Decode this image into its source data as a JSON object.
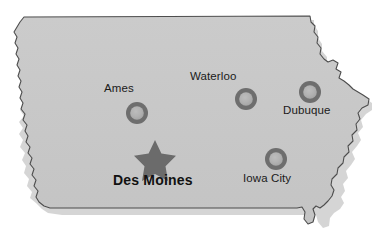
{
  "map": {
    "state": "Iowa",
    "fill_color": "#c8c8c8",
    "outline_color": "#4d4d4d",
    "shadow_color": "#b0b0b0",
    "background_color": "#ffffff",
    "marker_ring_color": "#6e6e6e",
    "marker_center_color": "#b4b4b4",
    "star_color": "#6b6b6b",
    "label_color": "#1a1a1a"
  },
  "cities": [
    {
      "name": "Ames",
      "label": "Ames",
      "marker": "city-dot-icon",
      "marker_x": 137,
      "marker_y": 113,
      "marker_r": 11
    },
    {
      "name": "Waterloo",
      "label": "Waterloo",
      "marker": "city-dot-icon",
      "marker_x": 246,
      "marker_y": 99,
      "marker_r": 11
    },
    {
      "name": "Dubuque",
      "label": "Dubuque",
      "marker": "city-dot-icon",
      "marker_x": 310,
      "marker_y": 92,
      "marker_r": 11
    },
    {
      "name": "Iowa City",
      "label": "Iowa City",
      "marker": "city-dot-icon",
      "marker_x": 276,
      "marker_y": 159,
      "marker_r": 11
    }
  ],
  "capital": {
    "name": "Des Moines",
    "label": "Des Moines",
    "marker": "star-icon",
    "marker_x": 155,
    "marker_y": 155
  }
}
